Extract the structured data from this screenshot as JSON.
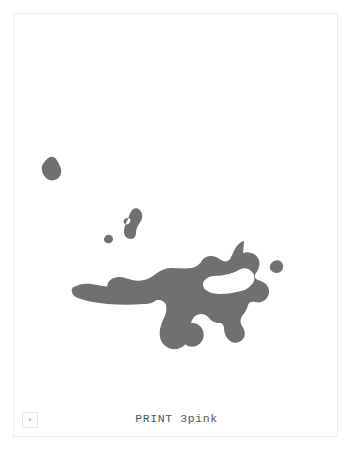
{
  "page": {
    "width": 353,
    "height": 459,
    "background_color": "#ffffff",
    "sheet": {
      "border_color": "#ececed",
      "fill_color": "#ffffff",
      "x": 13,
      "y": 13,
      "width": 325,
      "height": 424
    }
  },
  "caption": {
    "text": "PRINT 3pink",
    "color": "#55585c"
  },
  "corner_stamp": {
    "glyph": "■",
    "border_color": "#e2e3e4"
  },
  "artwork": {
    "name": "pink-printing-plate-separation",
    "ink_color": "#6e7072",
    "description": "Irregular gray ink blobs on a white sheet: one large central mass with arms, plus several small detached satellite marks.",
    "regions": [
      {
        "name": "satellite-blob-upper-left",
        "cx": 52,
        "cy": 168,
        "approx_size": 17
      },
      {
        "name": "satellite-blob-crescent-mid",
        "cx": 131,
        "cy": 219,
        "approx_size": 21
      },
      {
        "name": "satellite-dot-small",
        "cx": 110,
        "cy": 238,
        "approx_size": 7
      },
      {
        "name": "satellite-blob-right",
        "cx": 277,
        "cy": 267,
        "approx_size": 11
      },
      {
        "name": "main-ink-mass",
        "cx": 205,
        "cy": 295,
        "approx_size": 145
      },
      {
        "name": "detached-fragment-lower",
        "cx": 192,
        "cy": 334,
        "approx_size": 18
      }
    ]
  }
}
